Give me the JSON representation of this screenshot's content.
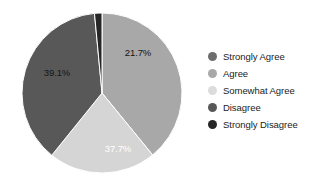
{
  "chart_data": {
    "type": "pie",
    "title": "",
    "subtitle": "",
    "xlabel": "",
    "ylabel": "",
    "grid": false,
    "legend_position": "right",
    "start_angle_deg": 0,
    "direction": "clockwise",
    "categories": [
      "Strongly Agree",
      "Agree",
      "Somewhat Agree",
      "Disagree",
      "Strongly Disagree"
    ],
    "values": [
      0.0,
      39.1,
      21.7,
      37.7,
      1.5
    ],
    "value_unit": "%",
    "slices": [
      {
        "label": "Strongly Agree",
        "value": 0.0,
        "display": "",
        "color": "#6e6e6e",
        "label_shown": false,
        "label_color": "#151515",
        "label_x": 0,
        "label_y": 0
      },
      {
        "label": "Agree",
        "value": 39.1,
        "display": "39.1%",
        "color": "#a8a8a8",
        "label_shown": true,
        "label_color": "#151515",
        "label_x": 57,
        "label_y": 72
      },
      {
        "label": "Somewhat Agree",
        "value": 21.7,
        "display": "21.7%",
        "color": "#d5d5d5",
        "label_shown": true,
        "label_color": "#151515",
        "label_x": 138,
        "label_y": 52
      },
      {
        "label": "Disagree",
        "value": 37.7,
        "display": "37.7%",
        "color": "#585858",
        "label_shown": true,
        "label_color": "#ffffff",
        "label_x": 118,
        "label_y": 148
      },
      {
        "label": "Strongly Disagree",
        "value": 1.5,
        "display": "",
        "color": "#262626",
        "label_shown": false,
        "label_color": "#ffffff",
        "label_x": 0,
        "label_y": 0
      }
    ],
    "geometry": {
      "center_x": 102,
      "center_y": 93,
      "radius": 80,
      "outline_color": "#ffffff",
      "outline_width": 1
    }
  },
  "legend": {
    "items": [
      {
        "label": "Strongly Agree",
        "color": "#6e6e6e"
      },
      {
        "label": "Agree",
        "color": "#a8a8a8"
      },
      {
        "label": "Somewhat Agree",
        "color": "#dcdcdc"
      },
      {
        "label": "Disagree",
        "color": "#585858"
      },
      {
        "label": "Strongly Disagree",
        "color": "#262626"
      }
    ]
  },
  "theme": {
    "background": "#ffffff",
    "text_color": "#1b1b1b"
  }
}
